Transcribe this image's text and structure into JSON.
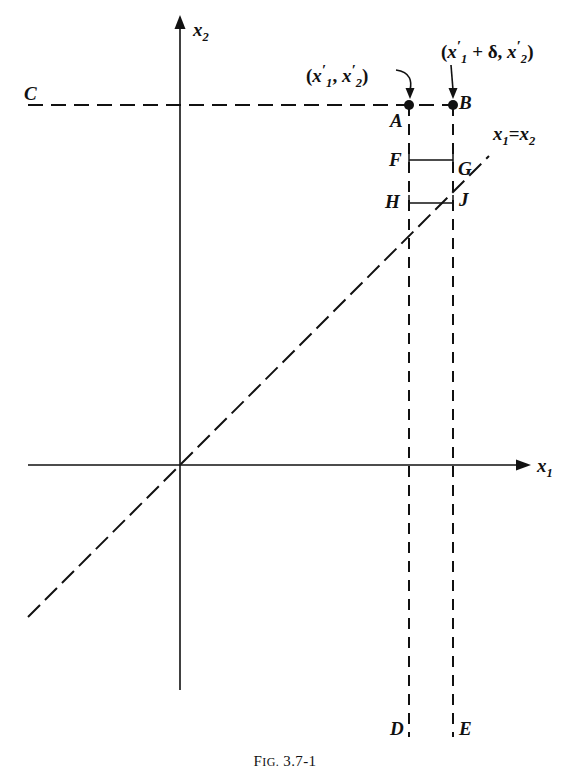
{
  "figure": {
    "caption_prefix": "F",
    "caption_smallcaps": "IG.",
    "caption_number": " 3.7-1",
    "caption_full": "Fig. 3.7-1"
  },
  "axes": {
    "x_axis_label": "x",
    "x_axis_sub": "1",
    "y_axis_label": "x",
    "y_axis_sub": "2",
    "origin": {
      "x": 180,
      "y": 465
    }
  },
  "diagonal": {
    "label_lhs": "x",
    "label_lhs_sub": "1",
    "label_eq": "=",
    "label_rhs": "x",
    "label_rhs_sub": "2",
    "label_full": "x1=x2"
  },
  "points": [
    {
      "name": "A",
      "label": "A",
      "x": 409,
      "y": 105,
      "dot": true
    },
    {
      "name": "B",
      "label": "B",
      "x": 453,
      "y": 105,
      "dot": true
    },
    {
      "name": "C",
      "label": "C",
      "x": 30,
      "y": 105,
      "dot": false
    },
    {
      "name": "D",
      "label": "D",
      "x": 409,
      "y": 730,
      "dot": false
    },
    {
      "name": "E",
      "label": "E",
      "x": 453,
      "y": 730,
      "dot": false
    },
    {
      "name": "F",
      "label": "F",
      "x": 409,
      "y": 160,
      "dot": false
    },
    {
      "name": "G",
      "label": "G",
      "x": 453,
      "y": 160,
      "dot": false
    },
    {
      "name": "H",
      "label": "H",
      "x": 409,
      "y": 203,
      "dot": false
    },
    {
      "name": "J",
      "label": "J",
      "x": 453,
      "y": 203,
      "dot": false
    }
  ],
  "annotations": {
    "point_a_coord": {
      "open": "(",
      "x1": "x",
      "x1_sub": "1",
      "prime": "′",
      "comma": ", ",
      "x2": "x",
      "x2_sub": "2",
      "close": ")",
      "text_full": "(x′1, x′2)"
    },
    "point_b_coord": {
      "open": "(",
      "x1": "x",
      "x1_sub": "1",
      "prime": "′",
      "plus_delta": " + δ, ",
      "x2": "x",
      "x2_sub": "2",
      "close": ")",
      "text_full": "(x′1 + δ, x′2)"
    }
  },
  "colors": {
    "ink": "#111111",
    "background": "#ffffff"
  }
}
